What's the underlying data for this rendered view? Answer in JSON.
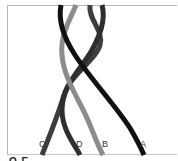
{
  "diagram": {
    "type": "braided-strands",
    "strands": [
      {
        "label": "A",
        "color": "#111111"
      },
      {
        "label": "B",
        "color": "#8a8a8a"
      },
      {
        "label": "C",
        "color": "#3a3a3a"
      },
      {
        "label": "D",
        "color": "#2a2a2a"
      }
    ],
    "labels": {
      "c": "C",
      "d": "D",
      "b": "B",
      "a": "A"
    },
    "caption_fragment": "Q E"
  }
}
